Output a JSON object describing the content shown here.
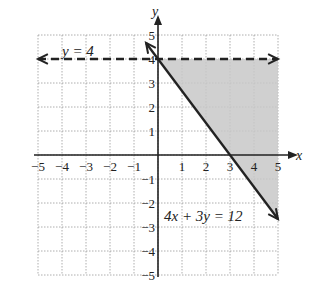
{
  "chart_data": {
    "type": "line",
    "title": "",
    "xlabel": "x",
    "ylabel": "y",
    "xlim": [
      -5,
      5
    ],
    "ylim": [
      -5,
      5
    ],
    "grid": true,
    "x_ticks": [
      "-5",
      "-4",
      "-3",
      "-2",
      "-1",
      "1",
      "2",
      "3",
      "4",
      "5"
    ],
    "y_ticks": [
      "5",
      "4",
      "3",
      "2",
      "1",
      "-1",
      "-2",
      "-3",
      "-4",
      "-5"
    ],
    "series": [
      {
        "name": "y = 4",
        "style": "dashed",
        "arrows": "both",
        "points": [
          [
            -5,
            4
          ],
          [
            5,
            4
          ]
        ]
      },
      {
        "name": "4x + 3y = 12",
        "style": "solid",
        "arrows": "both",
        "points": [
          [
            -0.5,
            4.67
          ],
          [
            5,
            -2.67
          ]
        ]
      }
    ],
    "shaded_region": {
      "description": "Region below y = 4 and to the right of 4x + 3y = 12 (4x + 3y >= 12, y < 4)",
      "vertices": [
        [
          0,
          4
        ],
        [
          5,
          4
        ],
        [
          5,
          -2.67
        ]
      ],
      "color": "#c8c8c8"
    },
    "annotations": [
      {
        "text": "y = 4",
        "x": -3.2,
        "y": 4.4
      },
      {
        "text": "4x + 3y = 12",
        "x": 2.6,
        "y": -2.9
      }
    ]
  },
  "labels": {
    "x_axis": "x",
    "y_axis": "y",
    "line1": "y = 4",
    "line2": "4x + 3y = 12"
  }
}
